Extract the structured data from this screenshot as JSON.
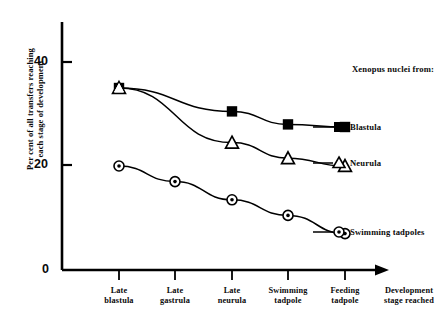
{
  "chart_data": {
    "type": "line",
    "title": "",
    "xlabel": "Development stage reached",
    "ylabel_line1": "Per cent of all transfers reaching",
    "ylabel_line2": "each stage of development",
    "categories": [
      "Late blastula",
      "Late gastrula",
      "Late neurula",
      "Swimming tadpole",
      "Feeding tadpole"
    ],
    "categories_wrapped": [
      [
        "Late",
        "blastula"
      ],
      [
        "Late",
        "gastrula"
      ],
      [
        "Late",
        "neurula"
      ],
      [
        "Swimming",
        "tadpole"
      ],
      [
        "Feeding",
        "tadpole"
      ]
    ],
    "xlabel_wrapped": [
      "Development",
      "stage reached"
    ],
    "ylim": [
      0,
      44
    ],
    "yticks": [
      0,
      20,
      40
    ],
    "ytick_labels": [
      "0",
      "20",
      "40"
    ],
    "grid": false,
    "legend_position": "right",
    "legend_title": "Xenopus nuclei from:",
    "series": [
      {
        "name": "Blastula",
        "marker": "filled-square",
        "color": "#000000",
        "values": [
          35,
          null,
          30.5,
          28,
          27.5
        ],
        "points_x": [
          119,
          175,
          232,
          288,
          345
        ]
      },
      {
        "name": "Neurula",
        "marker": "open-triangle",
        "color": "#000000",
        "values": [
          35,
          null,
          24.5,
          21.5,
          20
        ],
        "points_x": [
          119,
          175,
          232,
          288,
          345
        ]
      },
      {
        "name": "Swimming tadpoles",
        "marker": "circle-dot",
        "color": "#000000",
        "values": [
          20,
          17,
          13.5,
          10.5,
          7
        ],
        "points_x": [
          119,
          175,
          232,
          288,
          345
        ]
      }
    ],
    "axis_color": "#000000",
    "background": "#ffffff"
  },
  "legend": {
    "title": "Xenopus nuclei from:",
    "entries": [
      {
        "label": "Blastula",
        "marker": "filled-square"
      },
      {
        "label": "Neurula",
        "marker": "open-triangle"
      },
      {
        "label": "Swimming tadpoles",
        "marker": "circle-dot"
      }
    ]
  }
}
